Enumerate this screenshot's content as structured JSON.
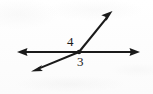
{
  "figure": {
    "background_color": "#fdfdfd",
    "ink_color": "#1a1a1a",
    "labels": {
      "angle_4": "4",
      "angle_3": "3"
    },
    "geometry": {
      "vertex": {
        "x": 79,
        "y": 52
      },
      "horizontal_line": {
        "name": "horizontal-double-arrow",
        "start": {
          "x": 17,
          "y": 52
        },
        "end": {
          "x": 140,
          "y": 52
        },
        "arrowheads": "both"
      },
      "transversal_line": {
        "name": "diagonal-double-arrow",
        "start": {
          "x": 32,
          "y": 71
        },
        "end": {
          "x": 112,
          "y": 11
        },
        "arrowheads": "both"
      }
    }
  }
}
